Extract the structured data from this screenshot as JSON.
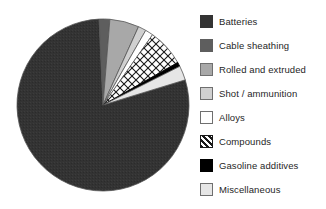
{
  "chart_data": {
    "type": "pie",
    "title": "",
    "subtitle": "",
    "xlabel": "",
    "ylabel": "",
    "grid": false,
    "legend_position": "right",
    "start_angle_deg": -17,
    "direction": "clockwise",
    "categories": [
      "Batteries",
      "Cable sheathing",
      "Rolled and extruded",
      "Shot / ammunition",
      "Alloys",
      "Compounds",
      "Gasoline additives",
      "Miscellaneous"
    ],
    "values": [
      79,
      2,
      5.5,
      1.5,
      1.5,
      7,
      0.8,
      2.7
    ],
    "units": "percent",
    "slices": [
      {
        "label": "Batteries",
        "value": 79,
        "color": "#333333",
        "pattern": "solid"
      },
      {
        "label": "Cable sheathing",
        "value": 2,
        "color": "#5e5e5e",
        "pattern": "solid"
      },
      {
        "label": "Rolled and extruded",
        "value": 5.5,
        "color": "#a8a8a8",
        "pattern": "solid"
      },
      {
        "label": "Shot / ammunition",
        "value": 1.5,
        "color": "#d0d0d0",
        "pattern": "solid"
      },
      {
        "label": "Alloys",
        "value": 1.5,
        "color": "#ffffff",
        "pattern": "solid"
      },
      {
        "label": "Compounds",
        "value": 7,
        "color": "#ffffff",
        "pattern": "diagonal-crosshatch"
      },
      {
        "label": "Gasoline additives",
        "value": 0.8,
        "color": "#000000",
        "pattern": "solid"
      },
      {
        "label": "Miscellaneous",
        "value": 2.7,
        "color": "#e6e6e6",
        "pattern": "solid"
      }
    ]
  },
  "legend": {
    "items": [
      {
        "label": "Batteries",
        "swatch_color": "#333333",
        "swatch_pattern": "solid"
      },
      {
        "label": "Cable sheathing",
        "swatch_color": "#5e5e5e",
        "swatch_pattern": "solid"
      },
      {
        "label": "Rolled and extruded",
        "swatch_color": "#a8a8a8",
        "swatch_pattern": "solid"
      },
      {
        "label": "Shot / ammunition",
        "swatch_color": "#d0d0d0",
        "swatch_pattern": "solid"
      },
      {
        "label": "Alloys",
        "swatch_color": "#ffffff",
        "swatch_pattern": "solid"
      },
      {
        "label": "Compounds",
        "swatch_color": "#ffffff",
        "swatch_pattern": "diagonal-crosshatch"
      },
      {
        "label": "Gasoline additives",
        "swatch_color": "#000000",
        "swatch_pattern": "solid"
      },
      {
        "label": "Miscellaneous",
        "swatch_color": "#e6e6e6",
        "swatch_pattern": "solid"
      }
    ]
  },
  "colors": {
    "background": "#ffffff",
    "text": "#262626",
    "slice_outline": "#555555",
    "swatch_outline": "#6f6f6f"
  }
}
